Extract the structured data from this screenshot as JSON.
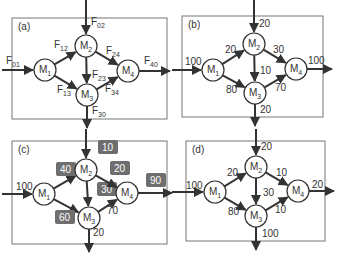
{
  "colors": {
    "line": "#333333",
    "box": "#777777",
    "node_fill": "#ffffff",
    "badge_fill": "#6e6e6e",
    "badge_text": "#ffffff",
    "text": "#333333"
  },
  "panels": [
    {
      "id": "a",
      "label": "(a)",
      "box": [
        12,
        18,
        155,
        101
      ],
      "nodes": [
        {
          "id": "M1",
          "name": "M",
          "sub": "1",
          "x": 45,
          "y": 70
        },
        {
          "id": "M2",
          "name": "M",
          "sub": "2",
          "x": 86,
          "y": 46
        },
        {
          "id": "M3",
          "name": "M",
          "sub": "3",
          "x": 87,
          "y": 95
        },
        {
          "id": "M4",
          "name": "M",
          "sub": "4",
          "x": 128,
          "y": 71
        }
      ],
      "edges": [
        {
          "from": "in",
          "to": "M1",
          "label": "F",
          "sub": "01",
          "lx": 6,
          "ly": 64
        },
        {
          "from": "in",
          "to": "M2",
          "label": "F",
          "sub": "02",
          "lx": 91,
          "ly": 25
        },
        {
          "from": "M1",
          "to": "M2",
          "label": "F",
          "sub": "12",
          "lx": 54,
          "ly": 48
        },
        {
          "from": "M1",
          "to": "M3",
          "label": "F",
          "sub": "13",
          "lx": 57,
          "ly": 93
        },
        {
          "from": "M2",
          "to": "M3",
          "label": "F",
          "sub": "23",
          "lx": 92,
          "ly": 78
        },
        {
          "from": "M2",
          "to": "M4",
          "label": "F",
          "sub": "24",
          "lx": 106,
          "ly": 54
        },
        {
          "from": "M3",
          "to": "M4",
          "label": "F",
          "sub": "34",
          "lx": 105,
          "ly": 92
        },
        {
          "from": "M4",
          "to": "out",
          "label": "F",
          "sub": "40",
          "lx": 144,
          "ly": 64
        },
        {
          "from": "M3",
          "to": "out",
          "label": "F",
          "sub": "30",
          "lx": 92,
          "ly": 114
        }
      ]
    },
    {
      "id": "b",
      "label": "(b)",
      "box": [
        182,
        16,
        141,
        101
      ],
      "nodes": [
        {
          "id": "M1",
          "name": "M",
          "sub": "1",
          "x": 213,
          "y": 70
        },
        {
          "id": "M2",
          "name": "M",
          "sub": "2",
          "x": 254,
          "y": 44
        },
        {
          "id": "M3",
          "name": "M",
          "sub": "3",
          "x": 255,
          "y": 93
        },
        {
          "id": "M4",
          "name": "M",
          "sub": "4",
          "x": 296,
          "y": 69
        }
      ],
      "edges": [
        {
          "from": "in",
          "to": "M1",
          "label": "100",
          "lx": 185,
          "ly": 65
        },
        {
          "from": "in",
          "to": "M2",
          "label": "20",
          "lx": 259,
          "ly": 27
        },
        {
          "from": "M1",
          "to": "M2",
          "label": "20",
          "lx": 225,
          "ly": 53
        },
        {
          "from": "M1",
          "to": "M3",
          "label": "80",
          "lx": 226,
          "ly": 93
        },
        {
          "from": "M2",
          "to": "M3",
          "label": "10",
          "lx": 260,
          "ly": 74
        },
        {
          "from": "M2",
          "to": "M4",
          "label": "30",
          "lx": 273,
          "ly": 53
        },
        {
          "from": "M3",
          "to": "M4",
          "label": "70",
          "lx": 275,
          "ly": 91
        },
        {
          "from": "M4",
          "to": "out",
          "label": "100",
          "lx": 308,
          "ly": 64
        },
        {
          "from": "M3",
          "to": "out",
          "label": "20",
          "lx": 260,
          "ly": 113
        }
      ]
    },
    {
      "id": "c",
      "label": "(c)",
      "box": [
        12,
        141,
        155,
        103
      ],
      "nodes": [
        {
          "id": "M1",
          "name": "M",
          "sub": "1",
          "x": 44,
          "y": 194
        },
        {
          "id": "M2",
          "name": "M",
          "sub": "2",
          "x": 86,
          "y": 170
        },
        {
          "id": "M3",
          "name": "M",
          "sub": "3",
          "x": 89,
          "y": 218
        },
        {
          "id": "M4",
          "name": "M",
          "sub": "4",
          "x": 127,
          "y": 193
        }
      ],
      "edges": [
        {
          "from": "in",
          "to": "M1",
          "label": "100",
          "lx": 16,
          "ly": 190,
          "badge": false
        },
        {
          "from": "in",
          "to": "M2",
          "label": "10",
          "lx": 101,
          "ly": 150,
          "badge": true
        },
        {
          "from": "M1",
          "to": "M2",
          "label": "40",
          "lx": 59,
          "ly": 172,
          "badge": true
        },
        {
          "from": "M1",
          "to": "M3",
          "label": "60",
          "lx": 58,
          "ly": 220,
          "badge": true
        },
        {
          "from": "M2",
          "to": "M3",
          "label": "30",
          "lx": 100,
          "ly": 192,
          "badge": true
        },
        {
          "from": "M2",
          "to": "M4",
          "label": "20",
          "lx": 113,
          "ly": 171,
          "badge": true
        },
        {
          "from": "M3",
          "to": "M4",
          "label": "70",
          "lx": 107,
          "ly": 214,
          "badge": false
        },
        {
          "from": "M4",
          "to": "out",
          "label": "90",
          "lx": 149,
          "ly": 183,
          "badge": true
        },
        {
          "from": "M3",
          "to": "out",
          "label": "20",
          "lx": 93,
          "ly": 236,
          "badge": false
        }
      ]
    },
    {
      "id": "d",
      "label": "(d)",
      "box": [
        186,
        141,
        139,
        100
      ],
      "nodes": [
        {
          "id": "M1",
          "name": "M",
          "sub": "1",
          "x": 215,
          "y": 192
        },
        {
          "id": "M2",
          "name": "M",
          "sub": "2",
          "x": 256,
          "y": 167
        },
        {
          "id": "M3",
          "name": "M",
          "sub": "3",
          "x": 256,
          "y": 216
        },
        {
          "id": "M4",
          "name": "M",
          "sub": "4",
          "x": 298,
          "y": 191
        }
      ],
      "edges": [
        {
          "from": "in",
          "to": "M1",
          "label": "100",
          "lx": 186,
          "ly": 189
        },
        {
          "from": "in",
          "to": "M2",
          "label": "20",
          "lx": 261,
          "ly": 150
        },
        {
          "from": "M1",
          "to": "M2",
          "label": "20",
          "lx": 227,
          "ly": 176
        },
        {
          "from": "M1",
          "to": "M3",
          "label": "80",
          "lx": 228,
          "ly": 215
        },
        {
          "from": "M2",
          "to": "M3",
          "label": "30",
          "lx": 263,
          "ly": 196
        },
        {
          "from": "M2",
          "to": "M4",
          "label": "10",
          "lx": 276,
          "ly": 176
        },
        {
          "from": "M3",
          "to": "M4",
          "label": "10",
          "lx": 275,
          "ly": 213
        },
        {
          "from": "M4",
          "to": "out",
          "label": "20",
          "lx": 312,
          "ly": 188
        },
        {
          "from": "M3",
          "to": "out",
          "label": "100",
          "lx": 262,
          "ly": 237
        }
      ]
    }
  ],
  "io": {
    "a": {
      "in_left": [
        2,
        70
      ],
      "in_top": [
        86,
        0
      ],
      "out_right": [
        170,
        71
      ],
      "out_bottom": [
        87,
        128
      ]
    },
    "b": {
      "in_left": [
        172,
        70
      ],
      "in_top": [
        254,
        0
      ],
      "out_right": [
        332,
        69
      ],
      "out_bottom": [
        255,
        126
      ]
    },
    "c": {
      "in_left": [
        2,
        194
      ],
      "in_top": [
        86,
        129
      ],
      "out_right": [
        172,
        193
      ],
      "out_bottom": [
        89,
        252
      ]
    },
    "d": {
      "in_left": [
        172,
        192
      ],
      "in_top": [
        256,
        129
      ],
      "out_right": [
        334,
        191
      ],
      "out_bottom": [
        256,
        250
      ]
    }
  }
}
